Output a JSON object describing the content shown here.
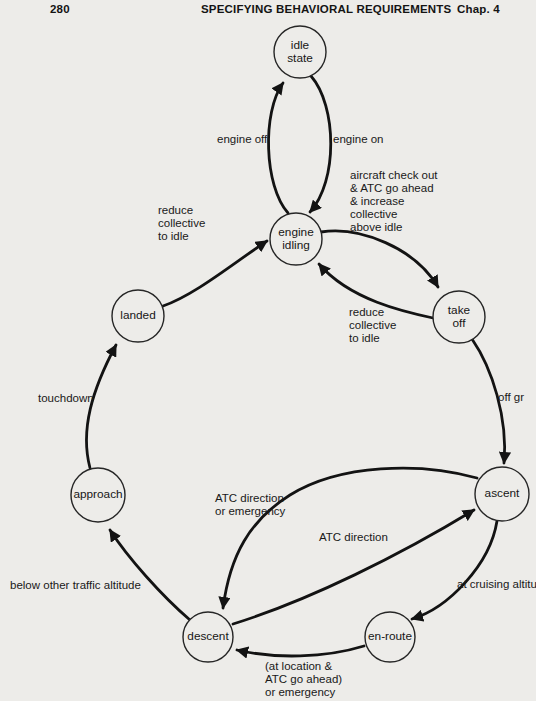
{
  "header": {
    "page_number": "280",
    "title": "SPECIFYING BEHAVIORAL REQUIREMENTS",
    "chapter": "Chap. 4"
  },
  "diagram": {
    "type": "state-transition-diagram",
    "states": [
      {
        "id": "idle-state",
        "label": "idle\nstate"
      },
      {
        "id": "engine-idling",
        "label": "engine\nidling"
      },
      {
        "id": "take-off",
        "label": "take\noff"
      },
      {
        "id": "ascent",
        "label": "ascent"
      },
      {
        "id": "en-route",
        "label": "en-route"
      },
      {
        "id": "descent",
        "label": "descent"
      },
      {
        "id": "approach",
        "label": "approach"
      },
      {
        "id": "landed",
        "label": "landed"
      }
    ],
    "transitions": [
      {
        "from": "engine-idling",
        "to": "idle-state",
        "label": "engine off"
      },
      {
        "from": "idle-state",
        "to": "engine-idling",
        "label": "engine on"
      },
      {
        "from": "engine-idling",
        "to": "take-off",
        "label": "aircraft check out\n& ATC go ahead\n& increase\ncollective\nabove idle"
      },
      {
        "from": "take-off",
        "to": "engine-idling",
        "label": "reduce\ncollective\nto idle"
      },
      {
        "from": "take-off",
        "to": "ascent",
        "label": "off gr"
      },
      {
        "from": "ascent",
        "to": "descent",
        "label": "ATC direction\nor emergency"
      },
      {
        "from": "descent",
        "to": "ascent",
        "label": "ATC direction"
      },
      {
        "from": "ascent",
        "to": "en-route",
        "label": "at cruising altitu"
      },
      {
        "from": "en-route",
        "to": "descent",
        "label": "(at location &\nATC go ahead)\nor emergency"
      },
      {
        "from": "descent",
        "to": "approach",
        "label": "below other traffic altitude"
      },
      {
        "from": "approach",
        "to": "landed",
        "label": "touchdown"
      },
      {
        "from": "landed",
        "to": "engine-idling",
        "label": "reduce\ncollective\nto idle"
      }
    ],
    "colors": {
      "paper": "#edece9",
      "ink": "#1a1a1a"
    }
  }
}
